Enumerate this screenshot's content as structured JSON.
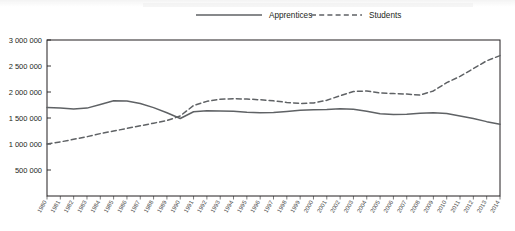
{
  "chart_data": {
    "type": "line",
    "title": "",
    "xlabel": "",
    "ylabel": "",
    "ylim": [
      0,
      3000000
    ],
    "ytick_values": [
      500000,
      1000000,
      1500000,
      2000000,
      2500000,
      3000000
    ],
    "ytick_labels": [
      "500 000",
      "1 000 000",
      "1 500 000",
      "2 000 000",
      "2 500 000",
      "3 000 000"
    ],
    "grid": false,
    "legend_position": "top-center",
    "categories": [
      1980,
      1981,
      1982,
      1983,
      1984,
      1985,
      1986,
      1987,
      1988,
      1989,
      1990,
      1991,
      1992,
      1993,
      1994,
      1995,
      1996,
      1997,
      1998,
      1999,
      2000,
      2001,
      2002,
      2003,
      2004,
      2005,
      2006,
      2007,
      2008,
      2009,
      2010,
      2011,
      2012,
      2013,
      2014
    ],
    "x_tick_labels": [
      "1980",
      "1981",
      "1982",
      "1983",
      "1984",
      "1985",
      "1986",
      "1987",
      "1988",
      "1989",
      "1990",
      "1991",
      "1992",
      "1993",
      "1994",
      "1995",
      "1996",
      "1997",
      "1998",
      "1999",
      "2000",
      "2001",
      "2002",
      "2003",
      "2004",
      "2005",
      "2006",
      "2007",
      "2008",
      "2009",
      "2010",
      "2011",
      "2012",
      "2013",
      "2014"
    ],
    "series": [
      {
        "name": "Apprentices",
        "style": "solid",
        "color": "#5f6265",
        "values": [
          1700000,
          1690000,
          1675000,
          1690000,
          1760000,
          1830000,
          1825000,
          1780000,
          1700000,
          1600000,
          1490000,
          1620000,
          1640000,
          1635000,
          1630000,
          1610000,
          1600000,
          1605000,
          1625000,
          1650000,
          1660000,
          1665000,
          1680000,
          1670000,
          1630000,
          1580000,
          1565000,
          1570000,
          1590000,
          1600000,
          1585000,
          1540000,
          1490000,
          1430000,
          1380000
        ]
      },
      {
        "name": "Students",
        "style": "dashed",
        "color": "#5f6265",
        "values": [
          1000000,
          1040000,
          1090000,
          1140000,
          1200000,
          1250000,
          1300000,
          1350000,
          1400000,
          1450000,
          1540000,
          1740000,
          1820000,
          1860000,
          1870000,
          1865000,
          1850000,
          1830000,
          1800000,
          1780000,
          1790000,
          1840000,
          1930000,
          2010000,
          2020000,
          1980000,
          1970000,
          1960000,
          1940000,
          2020000,
          2180000,
          2300000,
          2450000,
          2600000,
          2700000
        ]
      }
    ]
  },
  "legend": {
    "items": [
      {
        "label": "Apprentices",
        "style": "solid"
      },
      {
        "label": "Students",
        "style": "dashed"
      }
    ]
  }
}
